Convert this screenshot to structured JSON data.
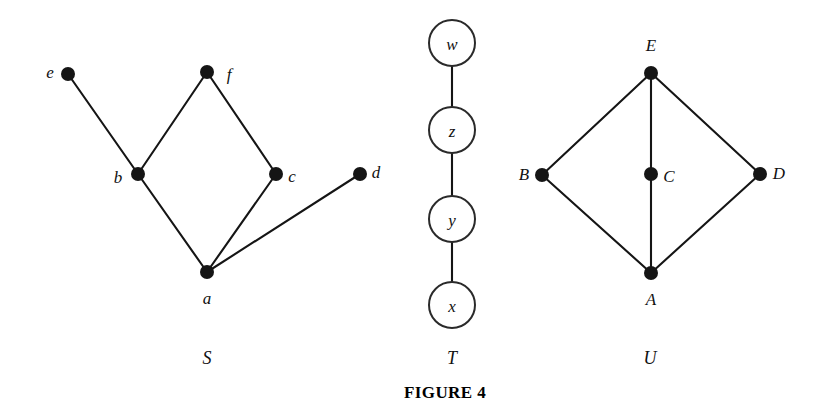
{
  "figure": {
    "caption": "FIGURE 4",
    "caption_x": 445,
    "caption_y": 392,
    "background": "#ffffff",
    "ink": "#151515",
    "width": 832,
    "height": 415
  },
  "graphs": [
    {
      "name": "S",
      "name_label": "S",
      "name_x": 207,
      "name_y": 358,
      "vertex_style": "filled-dot",
      "dot_radius": 7,
      "vertices": [
        {
          "id": "e",
          "label": "e",
          "x": 68,
          "y": 74,
          "label_x": 50,
          "label_y": 72
        },
        {
          "id": "f",
          "label": "f",
          "x": 207,
          "y": 72,
          "label_x": 229,
          "label_y": 74
        },
        {
          "id": "b",
          "label": "b",
          "x": 138,
          "y": 174,
          "label_x": 118,
          "label_y": 177
        },
        {
          "id": "c",
          "label": "c",
          "x": 276,
          "y": 174,
          "label_x": 292,
          "label_y": 176
        },
        {
          "id": "d",
          "label": "d",
          "x": 360,
          "y": 174,
          "label_x": 376,
          "label_y": 172
        },
        {
          "id": "a",
          "label": "a",
          "x": 207,
          "y": 272,
          "label_x": 207,
          "label_y": 298
        }
      ],
      "edges": [
        {
          "from": "e",
          "to": "b"
        },
        {
          "from": "b",
          "to": "f"
        },
        {
          "from": "f",
          "to": "c"
        },
        {
          "from": "b",
          "to": "a"
        },
        {
          "from": "c",
          "to": "a"
        },
        {
          "from": "a",
          "to": "d"
        }
      ]
    },
    {
      "name": "T",
      "name_label": "T",
      "name_x": 452,
      "name_y": 358,
      "vertex_style": "open-circle",
      "circle_radius": 23,
      "vertices": [
        {
          "id": "w",
          "label": "w",
          "x": 452,
          "y": 43
        },
        {
          "id": "z",
          "label": "z",
          "x": 452,
          "y": 130
        },
        {
          "id": "y",
          "label": "y",
          "x": 452,
          "y": 219
        },
        {
          "id": "x",
          "label": "x",
          "x": 452,
          "y": 305
        }
      ],
      "edges": [
        {
          "from": "w",
          "to": "z"
        },
        {
          "from": "z",
          "to": "y"
        },
        {
          "from": "y",
          "to": "x"
        }
      ]
    },
    {
      "name": "U",
      "name_label": "U",
      "name_x": 650,
      "name_y": 358,
      "vertex_style": "filled-dot",
      "dot_radius": 7,
      "vertices": [
        {
          "id": "E",
          "label": "E",
          "x": 651,
          "y": 73,
          "label_x": 651,
          "label_y": 45
        },
        {
          "id": "B",
          "label": "B",
          "x": 542,
          "y": 175,
          "label_x": 524,
          "label_y": 174
        },
        {
          "id": "C",
          "label": "C",
          "x": 651,
          "y": 174,
          "label_x": 669,
          "label_y": 176
        },
        {
          "id": "D",
          "label": "D",
          "x": 760,
          "y": 174,
          "label_x": 779,
          "label_y": 173
        },
        {
          "id": "A",
          "label": "A",
          "x": 651,
          "y": 273,
          "label_x": 651,
          "label_y": 299
        }
      ],
      "edges": [
        {
          "from": "E",
          "to": "B"
        },
        {
          "from": "E",
          "to": "C"
        },
        {
          "from": "E",
          "to": "D"
        },
        {
          "from": "B",
          "to": "A"
        },
        {
          "from": "C",
          "to": "A"
        },
        {
          "from": "D",
          "to": "A"
        }
      ]
    }
  ]
}
